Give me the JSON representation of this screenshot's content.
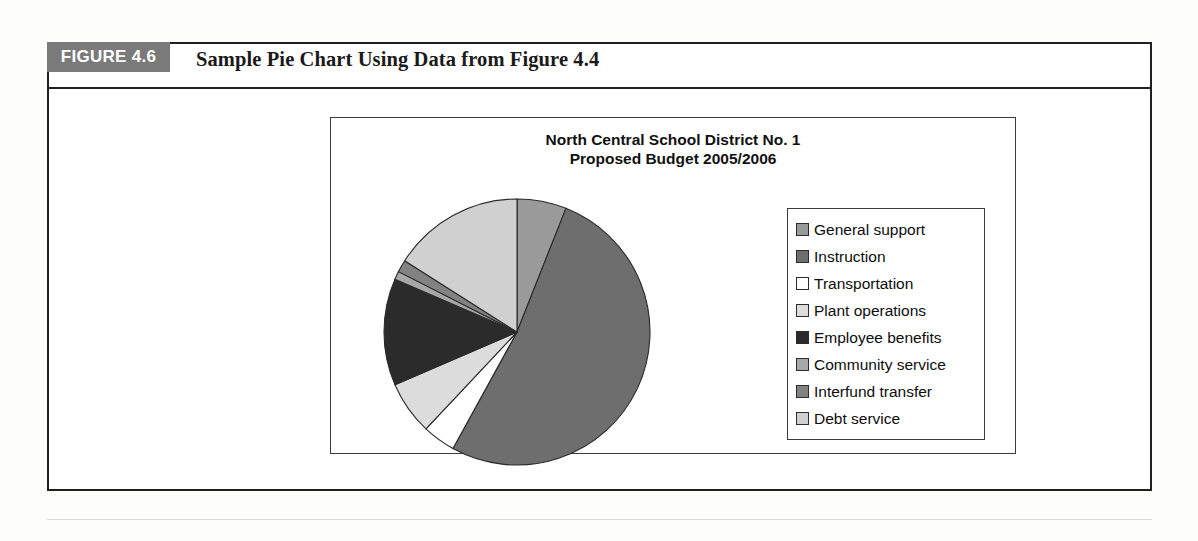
{
  "figure": {
    "tab_label": "FIGURE 4.6",
    "caption": "Sample Pie Chart Using Data from Figure 4.4"
  },
  "chart_title": {
    "line1": "North Central School District No. 1",
    "line2": "Proposed Budget 2005/2006"
  },
  "chart_data": {
    "type": "pie",
    "title": "North Central School District No. 1 Proposed Budget 2005/2006",
    "xlabel": "",
    "ylabel": "",
    "legend_position": "right",
    "grid": false,
    "start_angle_deg": 0,
    "direction": "clockwise",
    "categories": [
      "General support",
      "Instruction",
      "Transportation",
      "Plant operations",
      "Employee benefits",
      "Community service",
      "Interfund transfer",
      "Debt service"
    ],
    "values": [
      6.0,
      52.0,
      4.0,
      6.5,
      13.0,
      1.0,
      1.5,
      16.0
    ],
    "colors": [
      "#9a9a9a",
      "#6e6e6e",
      "#ffffff",
      "#dcdcdc",
      "#2b2b2b",
      "#a8a8a8",
      "#828282",
      "#d0d0d0"
    ]
  },
  "legend": {
    "items": [
      {
        "label": "General support",
        "color": "#9a9a9a"
      },
      {
        "label": "Instruction",
        "color": "#6e6e6e"
      },
      {
        "label": "Transportation",
        "color": "#ffffff"
      },
      {
        "label": "Plant operations",
        "color": "#dcdcdc"
      },
      {
        "label": "Employee benefits",
        "color": "#2b2b2b"
      },
      {
        "label": "Community service",
        "color": "#a8a8a8"
      },
      {
        "label": "Interfund transfer",
        "color": "#828282"
      },
      {
        "label": "Debt service",
        "color": "#d0d0d0"
      }
    ]
  }
}
